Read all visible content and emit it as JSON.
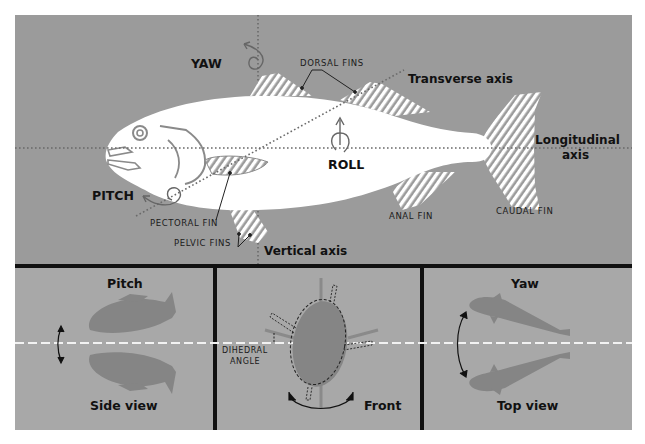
{
  "diagram": {
    "colors": {
      "background": "#9b9b9b",
      "panel_background": "#a8a8a8",
      "fish_body": "#ffffff",
      "fish_silhouette": "#858585",
      "divider": "#111111",
      "axis_dots": "#6a6a6a"
    },
    "top_panel": {
      "motions": {
        "yaw": "YAW",
        "pitch": "PITCH",
        "roll": "ROLL"
      },
      "axes": {
        "transverse": "Transverse axis",
        "longitudinal_line1": "Longitudinal",
        "longitudinal_line2": "axis",
        "vertical": "Vertical axis"
      },
      "fins": {
        "dorsal": "DORSAL FINS",
        "pectoral": "PECTORAL FIN",
        "pelvic": "PELVIC FINS",
        "anal": "ANAL FIN",
        "caudal": "CAUDAL FIN"
      }
    },
    "bottom_panels": [
      {
        "title": "Pitch",
        "caption": "Side view"
      },
      {
        "title": "",
        "caption": "Front",
        "annotation_line1": "DIHEDRAL",
        "annotation_line2": "ANGLE"
      },
      {
        "title": "Yaw",
        "caption": "Top view"
      }
    ]
  }
}
